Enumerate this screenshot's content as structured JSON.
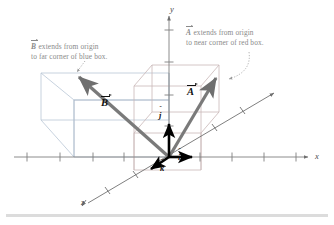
{
  "figure": {
    "kind": "3d-vector-diagram",
    "background_color": "#ffffff"
  },
  "axes": {
    "x_label": "x",
    "y_label": "y",
    "z_label": "z",
    "axis_color": "#808080",
    "origin_px": [
      169,
      157
    ],
    "x_axis": {
      "from_px": [
        14,
        157
      ],
      "to_px": [
        311,
        157
      ],
      "ticks_px": [
        27,
        60,
        93,
        124,
        200,
        232,
        264,
        296
      ]
    },
    "y_axis": {
      "from_px": [
        169,
        157
      ],
      "to_px": [
        169,
        14
      ],
      "ticks_px": [
        30,
        62,
        95,
        126
      ]
    },
    "z_axis": {
      "from_px": [
        88,
        203
      ],
      "to_px": [
        277,
        91
      ],
      "ticks_px": [
        [
          108,
          191
        ],
        [
          136,
          175
        ],
        [
          215,
          128
        ],
        [
          243,
          111
        ]
      ]
    }
  },
  "boxes": [
    {
      "name": "blue-box",
      "color": "#b9c6d6",
      "description": "left box, B extends to its far corner"
    },
    {
      "name": "red-box",
      "color": "#cdbcbc",
      "description": "right box, A extends to its near corner"
    }
  ],
  "vectors": [
    {
      "name": "B",
      "label": "B",
      "color": "#7a7a7a",
      "from_px": [
        169,
        157
      ],
      "to_px": [
        74,
        73
      ],
      "description": "extends from origin to far corner of blue box"
    },
    {
      "name": "A",
      "label": "A",
      "color": "#7a7a7a",
      "from_px": [
        169,
        157
      ],
      "to_px": [
        219,
        74
      ],
      "description": "extends from origin to near corner of red box"
    }
  ],
  "unit_vectors": [
    {
      "name": "i-hat",
      "label": "i",
      "hat": "ˆ",
      "color": "#000000",
      "from_px": [
        169,
        157
      ],
      "to_px": [
        196,
        157
      ]
    },
    {
      "name": "j-hat",
      "label": "j",
      "hat": "ˆ",
      "color": "#000000",
      "from_px": [
        169,
        157
      ],
      "to_px": [
        169,
        120
      ]
    },
    {
      "name": "k-hat",
      "label": "k",
      "hat": "ˆ",
      "color": "#000000",
      "from_px": [
        169,
        157
      ],
      "to_px": [
        148,
        171
      ]
    }
  ],
  "captions": {
    "b_caption": {
      "vector": "B",
      "line1_rest": " extends from origin",
      "line2": "to far corner of blue box.",
      "color": "#8a8a8a"
    },
    "a_caption": {
      "vector": "A",
      "line1_rest": " extends from origin",
      "line2": "to near corner of red box.",
      "color": "#8a8a8a"
    }
  },
  "leaders": [
    {
      "name": "b-leader",
      "style": "dotted",
      "color": "#9a9a9a"
    },
    {
      "name": "a-leader",
      "style": "dotted-curved",
      "color": "#9a9a9a"
    }
  ],
  "bottom_rule": {
    "color": "#dcdcdc"
  }
}
